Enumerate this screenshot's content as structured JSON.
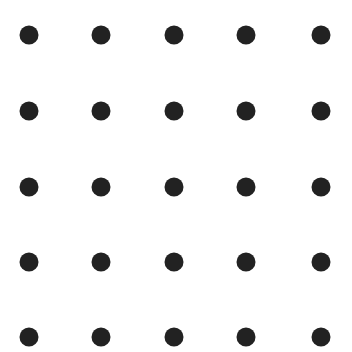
{
  "canvas": {
    "width": 352,
    "height": 352,
    "background": "#ffffff"
  },
  "dot_grid": {
    "rows": 5,
    "cols": 5,
    "dot_diameter": 19,
    "dot_color": "#222222",
    "col_centers": [
      29,
      101,
      174,
      246,
      321
    ],
    "row_centers": [
      35,
      111,
      187,
      262,
      337
    ]
  }
}
